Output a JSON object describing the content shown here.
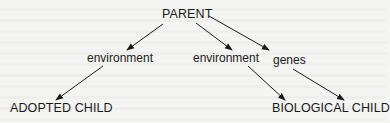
{
  "diagram": {
    "type": "directed-graph",
    "nodes": [
      {
        "id": "parent",
        "label": "PARENT"
      },
      {
        "id": "env_left",
        "label": "environment"
      },
      {
        "id": "env_mid",
        "label": "environment"
      },
      {
        "id": "genes",
        "label": "genes"
      },
      {
        "id": "adopted",
        "label": "ADOPTED CHILD"
      },
      {
        "id": "biological",
        "label": "BIOLOGICAL CHILD"
      }
    ],
    "edges": [
      {
        "from": "parent",
        "to": "env_left"
      },
      {
        "from": "parent",
        "to": "env_mid"
      },
      {
        "from": "parent",
        "to": "genes"
      },
      {
        "from": "env_left",
        "to": "adopted"
      },
      {
        "from": "env_mid",
        "to": "biological"
      },
      {
        "from": "genes",
        "to": "biological"
      }
    ],
    "colors": {
      "ink": "#1a1a1a",
      "background": "#f4f4f2"
    }
  },
  "labels": {
    "parent": "PARENT",
    "env_left": "environment",
    "env_mid": "environment",
    "genes": "genes",
    "adopted": "ADOPTED CHILD",
    "biological": "BIOLOGICAL CHILD"
  }
}
